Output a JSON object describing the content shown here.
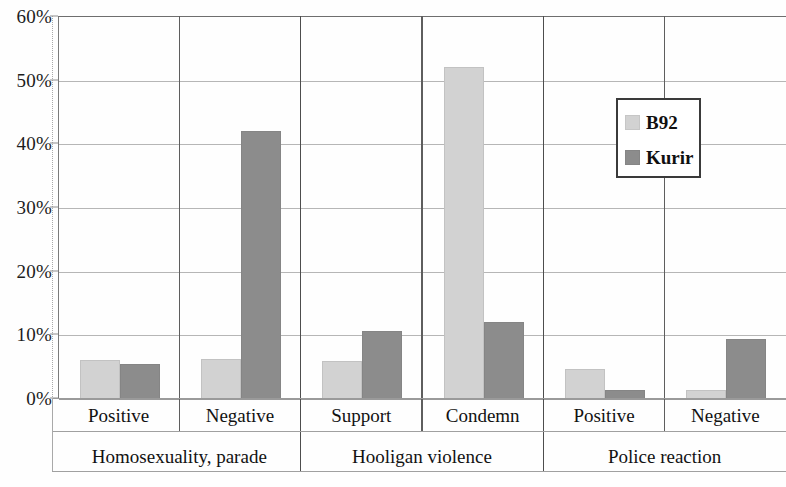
{
  "chart_data": {
    "type": "bar",
    "title": "",
    "subtitle": "",
    "xlabel": "",
    "ylabel": "",
    "ylim": [
      0,
      60
    ],
    "ytick_labels": [
      "0%",
      "10%",
      "20%",
      "30%",
      "40%",
      "50%",
      "60%"
    ],
    "ytick_values": [
      0,
      10,
      20,
      30,
      40,
      50,
      60
    ],
    "grid": true,
    "legend_position": "upper right",
    "categories": [
      "Positive",
      "Negative",
      "Support",
      "Condemn",
      "Positive",
      "Negative"
    ],
    "group_labels": [
      "Homosexuality, parade",
      "Hooligan violence",
      "Police reaction"
    ],
    "group_spans": [
      2,
      2,
      2
    ],
    "series": [
      {
        "name": "B92",
        "color": "#d2d2d2",
        "values": [
          6.0,
          6.2,
          5.8,
          52.0,
          4.5,
          1.3
        ]
      },
      {
        "name": "Kurir",
        "color": "#8c8c8c",
        "values": [
          5.4,
          42.0,
          10.6,
          11.9,
          1.3,
          9.3
        ]
      }
    ]
  },
  "chart": {
    "legend": {
      "entries": [
        {
          "label": "B92",
          "color": "#d2d2d2"
        },
        {
          "label": "Kurir",
          "color": "#8c8c8c"
        }
      ]
    },
    "axis": {
      "y_ticks": [
        "60%",
        "50%",
        "40%",
        "30%",
        "20%",
        "10%",
        "0%"
      ]
    },
    "categories": [
      {
        "label": "Positive",
        "b92": 6.0,
        "kurir": 5.4
      },
      {
        "label": "Negative",
        "b92": 6.2,
        "kurir": 42.0
      },
      {
        "label": "Support",
        "b92": 5.8,
        "kurir": 10.6
      },
      {
        "label": "Condemn",
        "b92": 52.0,
        "kurir": 11.9
      },
      {
        "label": "Positive",
        "b92": 4.5,
        "kurir": 1.3
      },
      {
        "label": "Negative",
        "b92": 15.0,
        "kurir": 9.3
      }
    ],
    "groups": [
      {
        "label": "Homosexuality, parade"
      },
      {
        "label": "Hooligan violence"
      },
      {
        "label": "Police reaction"
      }
    ]
  }
}
